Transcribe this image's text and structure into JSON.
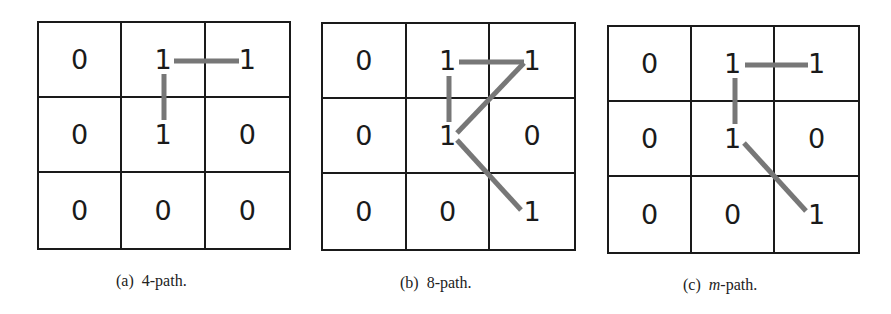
{
  "panels": [
    {
      "id": "a",
      "caption_prefix": "(a)",
      "caption_label": "4-path.",
      "caption_italic": "",
      "cells": [
        [
          "0",
          "1",
          "1"
        ],
        [
          "0",
          "1",
          "0"
        ],
        [
          "0",
          "0",
          "0"
        ]
      ]
    },
    {
      "id": "b",
      "caption_prefix": "(b)",
      "caption_label": "8-path.",
      "caption_italic": "",
      "cells": [
        [
          "0",
          "1",
          "1"
        ],
        [
          "0",
          "1",
          "0"
        ],
        [
          "0",
          "0",
          "1"
        ]
      ]
    },
    {
      "id": "c",
      "caption_prefix": "(c)",
      "caption_label": "-path.",
      "caption_italic": "m",
      "cells": [
        [
          "0",
          "1",
          "1"
        ],
        [
          "0",
          "1",
          "0"
        ],
        [
          "0",
          "0",
          "1"
        ]
      ]
    }
  ],
  "colors": {
    "grid_line": "#1a1a1a",
    "path_line": "#777777",
    "text": "#1a1a1a"
  }
}
